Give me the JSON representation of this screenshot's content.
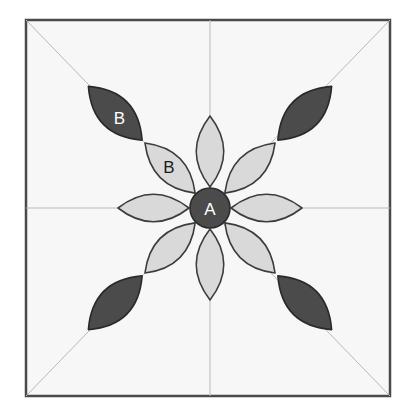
{
  "figure": {
    "canvas": {
      "width": 414,
      "height": 417
    },
    "background_color": "#ffffff"
  },
  "frame": {
    "name": "square-block-border",
    "x": 26,
    "y": 20,
    "width": 364,
    "height": 376,
    "fill_color": "#f7f7f7",
    "stroke_color": "#4a4a4a",
    "stroke_width": 2.5
  },
  "guides": {
    "stroke_color": "#b9b9b9",
    "stroke_width": 1,
    "lines": [
      {
        "name": "guide-horizontal",
        "x1": 26,
        "y1": 208,
        "x2": 390,
        "y2": 208
      },
      {
        "name": "guide-vertical",
        "x1": 210,
        "y1": 20,
        "x2": 210,
        "y2": 396
      },
      {
        "name": "guide-diagonal-nw-se",
        "x1": 26,
        "y1": 20,
        "x2": 390,
        "y2": 396
      },
      {
        "name": "guide-diagonal-ne-sw",
        "x1": 390,
        "y1": 20,
        "x2": 26,
        "y2": 396
      }
    ]
  },
  "colors": {
    "light_petal_fill": "#d9d9d9",
    "light_petal_stroke": "#3c3c3c",
    "dark_petal_fill": "#4b4b4b",
    "dark_petal_stroke": "#2a2a2a",
    "center_fill": "#4b4b4b",
    "center_stroke": "#2a2a2a",
    "label_light_text": "#ffffff",
    "label_dark_text": "#1a1a1a"
  },
  "center": {
    "name": "center-circle-a",
    "cx": 210,
    "cy": 208,
    "r": 20,
    "label": "A",
    "label_color": "#ffffff",
    "fill": "#4b4b4b"
  },
  "inner_petals": {
    "count": 8,
    "cx": 210,
    "cy": 208,
    "inner_radius": 21,
    "outer_radius": 92,
    "half_width": 17,
    "fill": "#d9d9d9",
    "stroke": "#3c3c3c",
    "items": [
      {
        "name": "inner-petal-n",
        "angle": -90,
        "label": "",
        "label_color": "#1a1a1a"
      },
      {
        "name": "inner-petal-ne",
        "angle": -45,
        "label": "",
        "label_color": "#1a1a1a"
      },
      {
        "name": "inner-petal-e",
        "angle": 0,
        "label": "",
        "label_color": "#1a1a1a"
      },
      {
        "name": "inner-petal-se",
        "angle": 45,
        "label": "",
        "label_color": "#1a1a1a"
      },
      {
        "name": "inner-petal-s",
        "angle": 90,
        "label": "",
        "label_color": "#1a1a1a"
      },
      {
        "name": "inner-petal-sw",
        "angle": 135,
        "label": "",
        "label_color": "#1a1a1a"
      },
      {
        "name": "inner-petal-w",
        "angle": 180,
        "label": "",
        "label_color": "#1a1a1a"
      },
      {
        "name": "inner-petal-nw",
        "angle": -135,
        "label": "B",
        "label_color": "#1a1a1a",
        "label_offset": 58
      }
    ]
  },
  "outer_petals": {
    "count": 4,
    "cx": 210,
    "cy": 208,
    "inner_radius": 96,
    "outer_radius": 172,
    "half_width": 20,
    "fill": "#4b4b4b",
    "stroke": "#2a2a2a",
    "items": [
      {
        "name": "outer-petal-nw",
        "angle": -135,
        "label": "B",
        "label_color": "#ffffff",
        "label_offset": 128
      },
      {
        "name": "outer-petal-ne",
        "angle": -45,
        "label": "",
        "label_color": "#ffffff"
      },
      {
        "name": "outer-petal-se",
        "angle": 45,
        "label": "",
        "label_color": "#ffffff"
      },
      {
        "name": "outer-petal-sw",
        "angle": 135,
        "label": "",
        "label_color": "#ffffff"
      }
    ]
  },
  "chart_data": {
    "type": "diagram",
    "labels": [
      "A",
      "B",
      "B"
    ],
    "label_placements": [
      {
        "label": "A",
        "element": "center-circle",
        "x": 210,
        "y": 208,
        "text_color": "#ffffff"
      },
      {
        "label": "B",
        "element": "outer-petal-nw",
        "x": 122,
        "y": 117,
        "text_color": "#ffffff"
      },
      {
        "label": "B",
        "element": "inner-petal-nw",
        "x": 169,
        "y": 165,
        "text_color": "#1a1a1a"
      }
    ],
    "legend": [
      {
        "name": "A",
        "meaning": "center circle unit",
        "swatch": "#4b4b4b"
      },
      {
        "name": "B",
        "meaning": "pointed petal unit",
        "swatch": "#d9d9d9"
      }
    ],
    "counts": {
      "center_circles": 1,
      "light_petals": 8,
      "dark_petals": 4,
      "guide_lines": 4
    }
  }
}
